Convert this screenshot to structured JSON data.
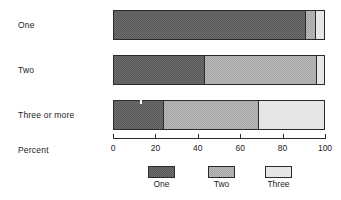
{
  "chart_data": {
    "type": "bar",
    "orientation": "horizontal",
    "stacked": true,
    "title": "",
    "xlabel": "Percent",
    "ylabel": "",
    "categories": [
      "One",
      "Two",
      "Three or more"
    ],
    "series": [
      {
        "name": "One",
        "color": "#6e6e6e",
        "values": [
          90,
          43,
          23.5
        ]
      },
      {
        "name": "Two",
        "color": "#b9b9b9",
        "values": [
          5,
          53,
          45
        ]
      },
      {
        "name": "Three",
        "color": "#ececec",
        "values": [
          4,
          4,
          31.5
        ]
      }
    ],
    "xlim": [
      0,
      100
    ],
    "xticks": [
      0,
      20,
      40,
      60,
      80,
      100
    ],
    "xtick_labels": [
      "0",
      "20",
      "40",
      "60",
      "80",
      "100"
    ],
    "grid": false,
    "legend_position": "bottom",
    "legend_entries": [
      "One",
      "Two",
      "Three"
    ]
  },
  "axis": {
    "title": "Percent"
  },
  "legend": {
    "items": [
      {
        "label": "One"
      },
      {
        "label": "Two"
      },
      {
        "label": "Three"
      }
    ]
  },
  "colors": {
    "one": "#6e6e6e",
    "two": "#b9b9b9",
    "three": "#ececec",
    "outline": "#2a2a2a",
    "background": "#ffffff"
  }
}
